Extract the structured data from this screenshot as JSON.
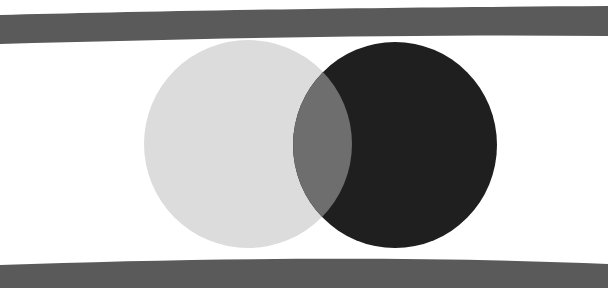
{
  "artwork": {
    "background_color": "#ffffff",
    "bands": [
      {
        "name": "top-band",
        "color": "#5a5a5a"
      },
      {
        "name": "bottom-band",
        "color": "#5a5a5a"
      }
    ],
    "circles": [
      {
        "name": "light-circle",
        "color": "#dcdcdc"
      },
      {
        "name": "dark-circle",
        "color": "#1f1f1f"
      }
    ],
    "overlap_color": "#6e6e6e"
  }
}
